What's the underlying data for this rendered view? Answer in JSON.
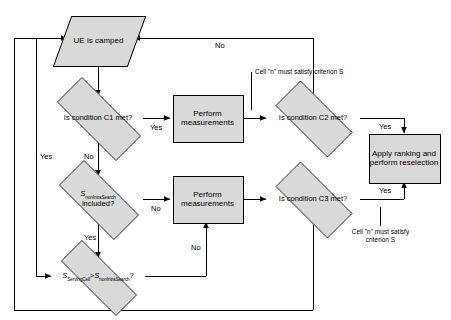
{
  "diagram": {
    "colors": {
      "shape_fill": "#d9d9d9",
      "shape_stroke": "#000000",
      "line": "#000000",
      "text": "#000000",
      "background": "#ffffff"
    },
    "nodes": {
      "ue_camped": {
        "label": "UE is camped",
        "shape": "parallelogram"
      },
      "cond_c1": {
        "label": "Is condition C1 met?",
        "shape": "diamond"
      },
      "meas_1": {
        "label": "Perform measurements",
        "shape": "process"
      },
      "cond_c2": {
        "label": "Is condition C2 met?",
        "shape": "diamond"
      },
      "reselect": {
        "label": "Apply ranking and perform reselection",
        "shape": "process"
      },
      "s_included": {
        "label_main": "included?",
        "var": "S",
        "var_sub": "nonIntraSearch",
        "shape": "diamond"
      },
      "meas_2": {
        "label": "Perform measurements",
        "shape": "process"
      },
      "cond_c3": {
        "label": "Is condition C3 met?",
        "shape": "diamond"
      },
      "s_compare": {
        "var_a": "S",
        "var_a_sub": "ServingCell",
        "operator": ">",
        "var_b": "S",
        "var_b_sub": "nonIntraSearch",
        "suffix": "?",
        "shape": "diamond"
      }
    },
    "edge_labels": {
      "c1_yes": "Yes",
      "c1_no": "No",
      "c2_no": "No",
      "c2_yes": "Yes",
      "c3_yes": "Yes",
      "c3_no_left": "Yes",
      "s_included_no": "No",
      "s_included_yes": "Yes",
      "s_compare_no": "No"
    },
    "annotations": {
      "note_c2": "Cell \"n\" must satisfy criterion S",
      "note_c3": "Cell \"n\" must satisfy criterion S"
    }
  }
}
